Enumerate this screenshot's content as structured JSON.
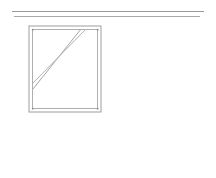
{
  "drawing": {
    "title": "Door and sidelight frame elevation",
    "type": "line-drawing",
    "canvas": {
      "width": 216,
      "height": 178,
      "background": "#ffffff"
    },
    "colors": {
      "primary_line": "#9a9a9a",
      "secondary_line": "#b4b4b4",
      "faint_line": "#cfcfcf",
      "background": "#ffffff"
    },
    "stroke_widths": {
      "main": 1,
      "fine": 0.8
    },
    "geometry": {
      "outer_frame": {
        "label": "Outer frame",
        "left_jamb": {
          "outer_x": 12,
          "inner_x": 19,
          "y_top": 10,
          "y_bottom": 172
        },
        "right_jamb": {
          "outer_x": 204,
          "inner_x": 197,
          "y_top": 10,
          "y_bottom": 172
        },
        "head_rail": {
          "y_outer": 11.5,
          "y_inner": 16.5,
          "x_left": 12,
          "x_right": 204
        }
      },
      "mullion": {
        "label": "Vertical mullion divider",
        "x": 110,
        "y_top": 16.5,
        "y_bottom": 172
      },
      "panel": {
        "label": "Glazed panel",
        "outer": {
          "x": 29,
          "y": 26,
          "width": 72,
          "height": 86
        },
        "inner": {
          "x": 32.5,
          "y": 29.5,
          "width": 65,
          "height": 79
        },
        "corner_marks": [
          {
            "x": 32.5,
            "y": 29.5
          },
          {
            "x": 97.5,
            "y": 29.5
          },
          {
            "x": 32.5,
            "y": 108.5
          },
          {
            "x": 97.5,
            "y": 108.5
          }
        ]
      },
      "diagonal": {
        "label": "Diagonal opening indicator",
        "line_a": {
          "x1": 33,
          "y1": 89,
          "x2": 81,
          "y2": 29
        },
        "line_b": {
          "x1": 33,
          "y1": 83,
          "x2": 86,
          "y2": 29
        }
      }
    },
    "elements": [
      {
        "name": "left-jamb-outer-line",
        "kind": "vertical-line"
      },
      {
        "name": "left-jamb-inner-line",
        "kind": "vertical-line"
      },
      {
        "name": "right-jamb-outer-line",
        "kind": "vertical-line"
      },
      {
        "name": "right-jamb-inner-line",
        "kind": "vertical-line"
      },
      {
        "name": "head-rail-upper-line",
        "kind": "horizontal-line"
      },
      {
        "name": "head-rail-lower-line",
        "kind": "horizontal-line"
      },
      {
        "name": "center-mullion-line",
        "kind": "vertical-line"
      },
      {
        "name": "panel-outer-rect",
        "kind": "rectangle"
      },
      {
        "name": "panel-inner-rect",
        "kind": "rectangle"
      },
      {
        "name": "panel-diagonal-line-a",
        "kind": "diagonal-line"
      },
      {
        "name": "panel-diagonal-line-b",
        "kind": "diagonal-line"
      }
    ]
  }
}
